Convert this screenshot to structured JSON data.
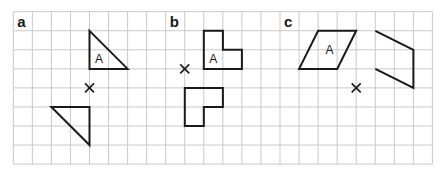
{
  "grid": {
    "columns": 22,
    "rows": 8,
    "line_color": "#c9c9c9"
  },
  "panels": [
    {
      "label": "a",
      "label_cell": [
        0,
        0
      ],
      "shape_label": "A",
      "transformation": "rotation 180° about centre",
      "centre": [
        4,
        4
      ],
      "object": {
        "points": [
          [
            4,
            1
          ],
          [
            4,
            3
          ],
          [
            6,
            3
          ]
        ],
        "closed": true
      },
      "object_label_at": [
        4.5,
        2.5
      ],
      "image": {
        "points": [
          [
            2,
            5
          ],
          [
            4,
            5
          ],
          [
            4,
            7
          ]
        ],
        "closed": true
      }
    },
    {
      "label": "b",
      "label_cell": [
        8,
        0
      ],
      "shape_label": "A",
      "transformation": "rotation about centre",
      "centre": [
        9,
        3
      ],
      "object": {
        "points": [
          [
            10,
            1
          ],
          [
            11,
            1
          ],
          [
            11,
            2
          ],
          [
            12,
            2
          ],
          [
            12,
            3
          ],
          [
            10,
            3
          ]
        ],
        "closed": true
      },
      "object_label_at": [
        10.5,
        2.5
      ],
      "image": {
        "points": [
          [
            9,
            4
          ],
          [
            11,
            4
          ],
          [
            11,
            5
          ],
          [
            10,
            5
          ],
          [
            10,
            6
          ],
          [
            9,
            6
          ]
        ],
        "closed": true
      }
    },
    {
      "label": "c",
      "label_cell": [
        14,
        0
      ],
      "shape_label": "A",
      "transformation": "rotation about centre",
      "centre": [
        18,
        4
      ],
      "object": {
        "points": [
          [
            16,
            1
          ],
          [
            18,
            1
          ],
          [
            17,
            3
          ],
          [
            15,
            3
          ]
        ],
        "closed": true
      },
      "object_label_at": [
        16.6,
        2.0
      ],
      "image": {
        "points": [
          [
            19,
            1
          ],
          [
            21,
            2
          ],
          [
            21,
            4
          ],
          [
            19,
            3
          ]
        ],
        "closed": false
      }
    }
  ],
  "colors": {
    "shape_stroke": "#1a1a1a",
    "background": "#ffffff"
  }
}
